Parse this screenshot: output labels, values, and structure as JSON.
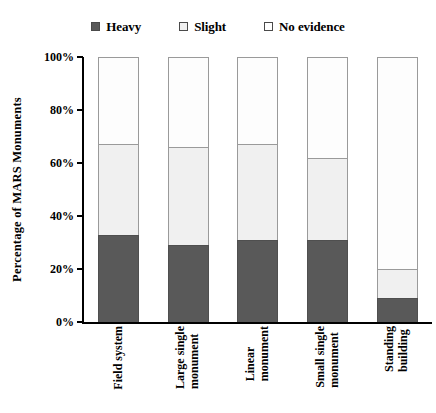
{
  "chart_data": {
    "type": "bar",
    "subtype": "stacked-bar-100",
    "title": "",
    "xlabel": "",
    "ylabel": "Percentage of MARS Monuments",
    "ylim": [
      0,
      100
    ],
    "yticks": [
      "0%",
      "20%",
      "40%",
      "60%",
      "80%",
      "100%"
    ],
    "ytick_values": [
      0,
      20,
      40,
      60,
      80,
      100
    ],
    "grid": false,
    "legend_position": "top-center",
    "categories": [
      "Field system",
      "Large single monument",
      "Linear monument",
      "Small single monument",
      "Standing building"
    ],
    "category_lines": [
      [
        "Field system",
        ""
      ],
      [
        "Large single",
        "monument"
      ],
      [
        "Linear",
        "monument"
      ],
      [
        "Small single",
        "monument"
      ],
      [
        "Standing",
        "building"
      ]
    ],
    "series": [
      {
        "name": "Heavy",
        "color": "#595959",
        "values": [
          33,
          29,
          31,
          31,
          9
        ]
      },
      {
        "name": "Slight",
        "color": "#f0f0f0",
        "values": [
          34,
          37,
          36,
          31,
          11
        ]
      },
      {
        "name": "No evidence",
        "color": "#ffffff",
        "values": [
          33,
          34,
          33,
          38,
          80
        ]
      }
    ]
  },
  "legend": {
    "items": [
      {
        "label": "Heavy",
        "swatch": "legend-swatch-heavy",
        "color": "#595959"
      },
      {
        "label": "Slight",
        "swatch": "legend-swatch-slight",
        "color": "#f0f0f0"
      },
      {
        "label": "No evidence",
        "swatch": "legend-swatch-no-evidence",
        "color": "#ffffff"
      }
    ]
  },
  "axes": {
    "y_title": "Percentage of MARS Monuments",
    "y_tick_labels": [
      "100%",
      "80%",
      "60%",
      "40%",
      "20%",
      "0%"
    ]
  }
}
